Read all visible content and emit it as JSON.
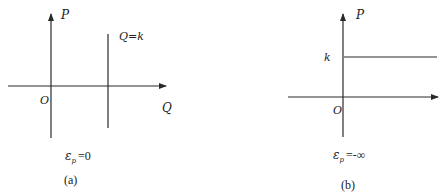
{
  "panels": [
    {
      "id": "a",
      "y_axis_label": "P",
      "x_axis_label": "Q",
      "origin_label": "O",
      "line_label": "Q=k",
      "elasticity_symbol": "ε",
      "elasticity_sub": "p",
      "elasticity_value": "=0",
      "caption": "(a)"
    },
    {
      "id": "b",
      "y_axis_label": "P",
      "origin_label": "O",
      "line_label": "k",
      "elasticity_symbol": "ε",
      "elasticity_sub": "p",
      "elasticity_value": "=-∞",
      "caption": "(b)"
    }
  ],
  "colors": {
    "line": "#2a2a2a",
    "text": "#222222"
  }
}
